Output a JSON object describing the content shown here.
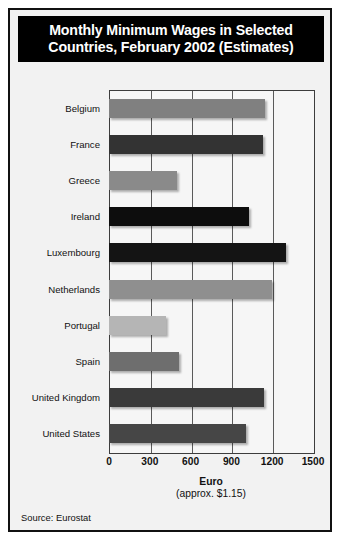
{
  "figure": {
    "title": "Monthly Minimum Wages in Selected\nCountries, February 2002 (Estimates)",
    "source": "Source: Eurostat",
    "axis_title_main": "Euro",
    "axis_title_sub": "(approx. $1.15)"
  },
  "chart_data": {
    "type": "bar",
    "orientation": "horizontal",
    "title": "Monthly Minimum Wages in Selected Countries, February 2002 (Estimates)",
    "xlabel": "Euro (approx. $1.15)",
    "ylabel": "",
    "xlim": [
      0,
      1500
    ],
    "xticks": [
      0,
      300,
      600,
      900,
      1200,
      1500
    ],
    "xticklabels": [
      "0",
      "300",
      "600",
      "900",
      "1200",
      "1500"
    ],
    "grid": true,
    "legend": false,
    "categories": [
      "Belgium",
      "France",
      "Greece",
      "Ireland",
      "Luxembourg",
      "Netherlands",
      "Portugal",
      "Spain",
      "United Kingdom",
      "United States"
    ],
    "values": [
      1150,
      1130,
      500,
      1030,
      1300,
      1200,
      420,
      515,
      1140,
      1010
    ],
    "bar_colors": [
      "#808080",
      "#333333",
      "#8a8a8a",
      "#0d0d0d",
      "#141414",
      "#8f8f8f",
      "#b5b5b5",
      "#6e6e6e",
      "#3a3a3a",
      "#464646"
    ],
    "series": [
      {
        "name": "Monthly minimum wage",
        "values": [
          1150,
          1130,
          500,
          1030,
          1300,
          1200,
          420,
          515,
          1140,
          1010
        ]
      }
    ]
  },
  "colors": {
    "banner_bg": "#000000",
    "banner_text": "#ffffff",
    "figure_bg": "#f2f2f2",
    "plot_bg": "#f6f6f6",
    "frame": "#3d3d3d",
    "border": "#111111"
  }
}
